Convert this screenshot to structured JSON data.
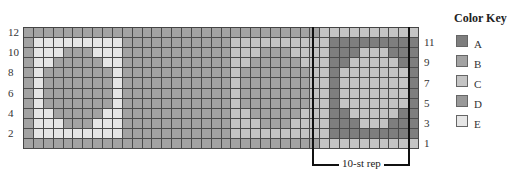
{
  "chart": {
    "rows": 12,
    "columns": 40,
    "row_labels_left": [
      "12",
      "10",
      "8",
      "6",
      "4",
      "2"
    ],
    "row_labels_right": [
      "11",
      "9",
      "7",
      "5",
      "3",
      "1"
    ],
    "repeat_label": "10-st rep",
    "repeat_columns": [
      30,
      39
    ]
  },
  "color_key": {
    "title": "Color Key",
    "items": [
      {
        "label": "A",
        "color": "#7e7e7e"
      },
      {
        "label": "B",
        "color": "#a3a3a3"
      },
      {
        "label": "C",
        "color": "#c4c4c4"
      },
      {
        "label": "D",
        "color": "#999999"
      },
      {
        "label": "E",
        "color": "#e6e6e6"
      }
    ]
  },
  "motifs": [
    {
      "background": "B",
      "ring": "E",
      "center": "B"
    },
    {
      "background": "B",
      "ring": "B",
      "center": "B"
    },
    {
      "background": "B",
      "ring": "C",
      "center": "B"
    },
    {
      "background": "C",
      "ring": "A",
      "center": "C",
      "corner": "D"
    }
  ],
  "edge_column_color": "C"
}
